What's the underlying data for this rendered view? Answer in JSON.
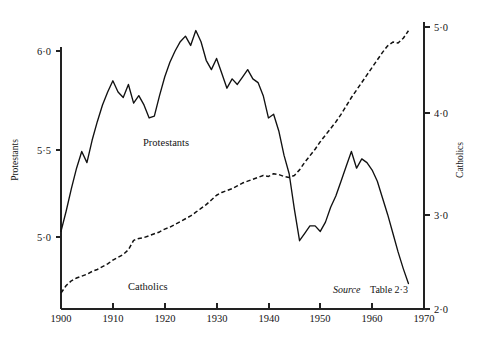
{
  "figure": {
    "background_color": "#ffffff",
    "ink_color": "#141414"
  },
  "chart_data": {
    "type": "line",
    "title": "",
    "xlabel": "",
    "grid": false,
    "legend_position": "inline-labels",
    "x": [
      1900,
      1901,
      1902,
      1903,
      1904,
      1905,
      1906,
      1907,
      1908,
      1909,
      1910,
      1911,
      1912,
      1913,
      1914,
      1915,
      1916,
      1917,
      1918,
      1919,
      1920,
      1921,
      1922,
      1923,
      1924,
      1925,
      1926,
      1927,
      1928,
      1929,
      1930,
      1931,
      1932,
      1933,
      1934,
      1935,
      1936,
      1937,
      1938,
      1939,
      1940,
      1941,
      1942,
      1943,
      1944,
      1945,
      1946,
      1947,
      1948,
      1949,
      1950,
      1951,
      1952,
      1953,
      1954,
      1955,
      1956,
      1957,
      1958,
      1959,
      1960,
      1961,
      1962,
      1963,
      1964,
      1965,
      1966,
      1967
    ],
    "xlim": [
      1900,
      1970
    ],
    "xticks": [
      1900,
      1910,
      1920,
      1930,
      1940,
      1950,
      1960,
      1970
    ],
    "xticklabels": [
      "1900",
      "1910",
      "1920",
      "1930",
      "1940",
      "1950",
      "1960",
      "1970"
    ],
    "axes": [
      {
        "id": "left",
        "label": "Protestants",
        "ticks": [
          5.0,
          5.5,
          6.0
        ],
        "ticklabels": [
          "5·0",
          "5·5",
          "6·0"
        ],
        "lim": [
          4.73,
          6.26
        ]
      },
      {
        "id": "right",
        "label": "Catholics",
        "ticks": [
          2.0,
          3.0,
          4.0,
          5.0
        ],
        "ticklabels": [
          "2·0",
          "3·0",
          "4·0",
          "5·0"
        ],
        "lim": [
          2.0,
          5.08
        ]
      }
    ],
    "series": [
      {
        "name": "Protestants",
        "axis": "left",
        "style": "solid",
        "label_text": "Protestants",
        "values": [
          5.03,
          5.14,
          5.26,
          5.37,
          5.46,
          5.4,
          5.52,
          5.62,
          5.71,
          5.78,
          5.84,
          5.78,
          5.75,
          5.82,
          5.72,
          5.76,
          5.71,
          5.64,
          5.65,
          5.76,
          5.86,
          5.94,
          6.0,
          6.05,
          6.08,
          6.03,
          6.11,
          6.05,
          5.95,
          5.9,
          5.96,
          5.88,
          5.8,
          5.85,
          5.82,
          5.86,
          5.9,
          5.85,
          5.83,
          5.76,
          5.64,
          5.66,
          5.57,
          5.44,
          5.34,
          5.15,
          4.98,
          5.02,
          5.06,
          5.06,
          5.03,
          5.08,
          5.16,
          5.22,
          5.3,
          5.38,
          5.46,
          5.37,
          5.42,
          5.4,
          5.36,
          5.3,
          5.21,
          5.12,
          5.02,
          4.92,
          4.83,
          4.75
        ]
      },
      {
        "name": "Catholics",
        "axis": "right",
        "style": "dashed",
        "label_text": "Catholics",
        "values": [
          2.17,
          2.25,
          2.3,
          2.33,
          2.35,
          2.37,
          2.4,
          2.42,
          2.45,
          2.48,
          2.52,
          2.55,
          2.58,
          2.63,
          2.73,
          2.75,
          2.76,
          2.78,
          2.8,
          2.82,
          2.85,
          2.87,
          2.9,
          2.93,
          2.96,
          2.99,
          3.03,
          3.07,
          3.11,
          3.16,
          3.21,
          3.24,
          3.26,
          3.28,
          3.31,
          3.34,
          3.36,
          3.38,
          3.4,
          3.42,
          3.41,
          3.44,
          3.43,
          3.41,
          3.4,
          3.42,
          3.48,
          3.56,
          3.63,
          3.7,
          3.78,
          3.85,
          3.92,
          3.99,
          4.07,
          4.16,
          4.25,
          4.33,
          4.41,
          4.49,
          4.57,
          4.65,
          4.73,
          4.8,
          4.84,
          4.83,
          4.88,
          4.96
        ]
      }
    ],
    "annotations": [
      {
        "name": "source-note",
        "prefix": "Source",
        "text": "Table 2·3"
      }
    ]
  }
}
